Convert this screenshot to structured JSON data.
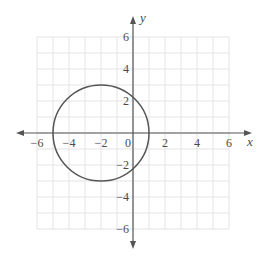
{
  "chart_data": {
    "type": "line",
    "title": "",
    "xlabel": "x",
    "ylabel": "y",
    "xlim": [
      -6,
      6
    ],
    "ylim": [
      -6,
      6
    ],
    "grid": true,
    "grid_step": 1,
    "x_ticks": [
      -6,
      -4,
      -2,
      0,
      2,
      4,
      6
    ],
    "y_ticks": [
      -6,
      -4,
      -2,
      2,
      4,
      6
    ],
    "x_tick_labels": [
      "−6",
      "−4",
      "−2",
      "0",
      "2",
      "4",
      "6"
    ],
    "y_tick_labels": [
      "−6",
      "−4",
      "−2",
      "2",
      "4",
      "6"
    ],
    "series": [
      {
        "name": "circle",
        "shape": "circle",
        "center": [
          -2,
          0
        ],
        "radius": 3,
        "equation": "(x + 2)^2 + y^2 = 9",
        "key_points": [
          [
            -5,
            0
          ],
          [
            1,
            0
          ],
          [
            -2,
            3
          ],
          [
            -2,
            -3
          ]
        ]
      }
    ],
    "legend": null
  },
  "colors": {
    "axis": "#555555",
    "grid": "#e3e3e3",
    "curve": "#555555",
    "text": "#4a4a4a"
  }
}
